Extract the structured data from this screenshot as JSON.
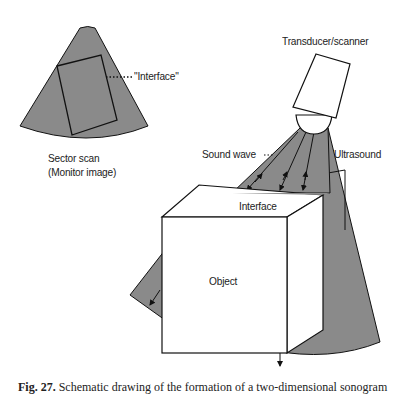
{
  "labels": {
    "interface_monitor": "\"Interface\"",
    "sector_scan_line1": "Sector scan",
    "sector_scan_line2": "(Monitor image)",
    "transducer": "Transducer/scanner",
    "sound_wave": "Sound wave",
    "ultrasound": "Ultrasound",
    "interface": "Interface",
    "object": "Object"
  },
  "caption": {
    "prefix": "Fig. 27.",
    "text": "Schematic drawing of the formation of a two-dimensional sonogram"
  },
  "colors": {
    "beam_gray": "#8a8a8a",
    "outline": "#111111",
    "background": "#ffffff"
  }
}
